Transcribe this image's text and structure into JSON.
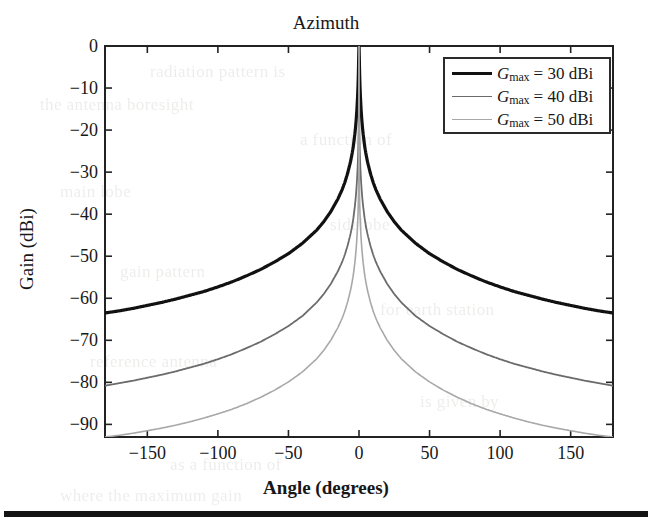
{
  "figure": {
    "title": "Azimuth",
    "xaxis_title": "Angle (degrees)",
    "yaxis_title": "Gain (dBi)"
  },
  "legend": {
    "entries": [
      {
        "symbol": "G",
        "subscript": "max",
        "value_text": "= 30 dBi",
        "gmax_dbi": 30,
        "color": "#111111",
        "line_width": 3.2
      },
      {
        "symbol": "G",
        "subscript": "max",
        "value_text": "= 40 dBi",
        "gmax_dbi": 40,
        "color": "#6b6b6b",
        "line_width": 1.8
      },
      {
        "symbol": "G",
        "subscript": "max",
        "value_text": "= 50 dBi",
        "gmax_dbi": 50,
        "color": "#a8a8a8",
        "line_width": 1.6
      }
    ]
  },
  "bleed_text": [
    {
      "text": "radiation pattern is",
      "x": 150,
      "y": 62
    },
    {
      "text": "the antenna boresight",
      "x": 40,
      "y": 95
    },
    {
      "text": "a function of",
      "x": 300,
      "y": 130
    },
    {
      "text": "main lobe",
      "x": 60,
      "y": 182
    },
    {
      "text": "sidelobe",
      "x": 330,
      "y": 215
    },
    {
      "text": "gain pattern",
      "x": 120,
      "y": 262
    },
    {
      "text": "for earth station",
      "x": 380,
      "y": 300
    },
    {
      "text": "reference antenna",
      "x": 90,
      "y": 352
    },
    {
      "text": "is given by",
      "x": 420,
      "y": 392
    },
    {
      "text": "as a function of",
      "x": 170,
      "y": 455
    },
    {
      "text": "where the maximum gain",
      "x": 60,
      "y": 486
    }
  ],
  "chart_data": {
    "type": "line",
    "title": "Azimuth",
    "xlabel": "Angle (degrees)",
    "ylabel": "Gain (dBi)",
    "xlim": [
      -180,
      180
    ],
    "ylim": [
      -93,
      0
    ],
    "xticks": [
      -150,
      -100,
      -50,
      0,
      50,
      100,
      150
    ],
    "xticklabels": [
      "−150",
      "−100",
      "−50",
      "0",
      "50",
      "100",
      "150"
    ],
    "yticks": [
      0,
      -10,
      -20,
      -30,
      -40,
      -50,
      -60,
      -70,
      -80,
      -90
    ],
    "yticklabels": [
      "0",
      "−10",
      "−20",
      "−30",
      "−40",
      "−50",
      "−60",
      "−70",
      "−80",
      "−90"
    ],
    "grid": false,
    "legend_position": "upper right",
    "x": [
      -180,
      -170,
      -160,
      -150,
      -140,
      -130,
      -120,
      -110,
      -100,
      -90,
      -80,
      -70,
      -60,
      -50,
      -40,
      -30,
      -25,
      -20,
      -15,
      -12,
      -10,
      -8,
      -6,
      -5,
      -4,
      -3,
      -2.5,
      -2,
      -1.5,
      -1,
      -0.7,
      -0.5,
      -0.35,
      -0.25,
      -0.15,
      -0.08,
      0,
      0.08,
      0.15,
      0.25,
      0.35,
      0.5,
      0.7,
      1,
      1.5,
      2,
      2.5,
      3,
      4,
      5,
      6,
      8,
      10,
      12,
      15,
      20,
      25,
      30,
      40,
      50,
      60,
      70,
      80,
      90,
      100,
      110,
      120,
      130,
      140,
      150,
      160,
      170,
      180
    ],
    "series": [
      {
        "name": "G_max = 30 dBi",
        "gmax_dbi": 30,
        "color": "#111111",
        "line_width": 3.2,
        "values": [
          -63.5,
          -63.0,
          -62.4,
          -61.7,
          -61.0,
          -60.2,
          -59.3,
          -58.4,
          -57.3,
          -56.1,
          -54.7,
          -53.2,
          -51.4,
          -49.4,
          -46.9,
          -43.8,
          -41.8,
          -39.4,
          -36.4,
          -34.2,
          -32.4,
          -30.2,
          -27.5,
          -25.8,
          -23.8,
          -21.1,
          -19.5,
          -17.6,
          -15.2,
          -12.0,
          -9.5,
          -7.3,
          -5.2,
          -3.4,
          -1.8,
          -0.6,
          0.0,
          -0.6,
          -1.8,
          -3.4,
          -5.2,
          -7.3,
          -9.5,
          -12.0,
          -15.2,
          -17.6,
          -19.5,
          -21.1,
          -23.8,
          -25.8,
          -27.5,
          -30.2,
          -32.4,
          -34.2,
          -36.4,
          -39.4,
          -41.8,
          -43.8,
          -46.9,
          -49.4,
          -51.4,
          -53.2,
          -54.7,
          -56.1,
          -57.3,
          -58.4,
          -59.3,
          -60.2,
          -61.0,
          -61.7,
          -62.4,
          -63.0,
          -63.5
        ]
      },
      {
        "name": "G_max = 40 dBi",
        "gmax_dbi": 40,
        "color": "#6b6b6b",
        "line_width": 1.8,
        "values": [
          -80.8,
          -80.2,
          -79.6,
          -78.9,
          -78.2,
          -77.4,
          -76.5,
          -75.6,
          -74.5,
          -73.3,
          -71.9,
          -70.4,
          -68.6,
          -66.6,
          -64.2,
          -61.0,
          -59.0,
          -56.6,
          -53.6,
          -51.4,
          -49.6,
          -47.4,
          -44.7,
          -43.1,
          -41.0,
          -38.3,
          -36.7,
          -34.8,
          -32.4,
          -29.2,
          -26.5,
          -24.2,
          -21.7,
          -19.2,
          -15.8,
          -11.7,
          0.0,
          -11.7,
          -15.8,
          -19.2,
          -21.7,
          -24.2,
          -26.5,
          -29.2,
          -32.4,
          -34.8,
          -36.7,
          -38.3,
          -41.0,
          -43.1,
          -44.7,
          -47.4,
          -49.6,
          -51.4,
          -53.6,
          -56.6,
          -59.0,
          -61.0,
          -64.2,
          -66.6,
          -68.6,
          -70.4,
          -71.9,
          -73.3,
          -74.5,
          -75.6,
          -76.5,
          -77.4,
          -78.2,
          -78.9,
          -79.6,
          -80.2,
          -80.8
        ]
      },
      {
        "name": "G_max = 50 dBi",
        "gmax_dbi": 50,
        "color": "#a8a8a8",
        "line_width": 1.6,
        "values": [
          -93.0,
          -92.6,
          -92.1,
          -91.5,
          -90.9,
          -90.2,
          -89.4,
          -88.5,
          -87.5,
          -86.4,
          -85.1,
          -83.6,
          -81.9,
          -79.9,
          -77.5,
          -74.4,
          -72.4,
          -70.0,
          -67.0,
          -64.8,
          -63.0,
          -60.8,
          -58.1,
          -56.4,
          -54.4,
          -51.7,
          -50.1,
          -48.2,
          -45.8,
          -42.6,
          -39.9,
          -37.5,
          -34.9,
          -32.2,
          -28.6,
          -24.0,
          0.0,
          -24.0,
          -28.6,
          -32.2,
          -34.9,
          -37.5,
          -39.9,
          -42.6,
          -45.8,
          -48.2,
          -50.1,
          -51.7,
          -54.4,
          -56.4,
          -58.1,
          -60.8,
          -63.0,
          -64.8,
          -67.0,
          -70.0,
          -72.4,
          -74.4,
          -77.5,
          -79.9,
          -81.9,
          -83.6,
          -85.1,
          -86.4,
          -87.5,
          -88.5,
          -89.4,
          -90.2,
          -90.9,
          -91.5,
          -92.1,
          -92.6,
          -93.0
        ]
      }
    ]
  }
}
